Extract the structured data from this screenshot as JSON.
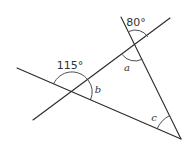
{
  "diagram": {
    "type": "geometry-angles",
    "angles": [
      {
        "id": "angle-80",
        "label": "80°",
        "kind": "given",
        "location": "top intersection, above the rising line"
      },
      {
        "id": "angle-115",
        "label": "115°",
        "kind": "given",
        "location": "left intersection, above the falling line"
      },
      {
        "id": "angle-a",
        "label": "a",
        "kind": "unknown",
        "location": "top intersection, interior of triangle"
      },
      {
        "id": "angle-b",
        "label": "b",
        "kind": "unknown",
        "location": "left intersection, interior of triangle"
      },
      {
        "id": "angle-c",
        "label": "c",
        "kind": "unknown",
        "location": "bottom-right vertex, interior of triangle"
      }
    ],
    "labels": {
      "deg80": "80°",
      "deg115": "115°",
      "a": "a",
      "b": "b",
      "c": "c"
    },
    "colors": {
      "line": "#2a2a2a",
      "text": "#333333",
      "background": "#ffffff"
    }
  }
}
